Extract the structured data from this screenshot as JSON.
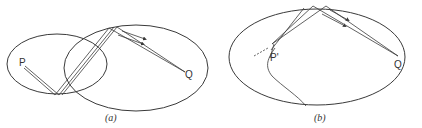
{
  "panel_a": {
    "caption": "(a)",
    "point_p": "P",
    "point_q": "Q"
  },
  "panel_b": {
    "caption": "(b)",
    "point_p": "P'",
    "point_q": "Q"
  },
  "colors": {
    "stroke": "#3a3a3a",
    "background": "#ffffff"
  }
}
